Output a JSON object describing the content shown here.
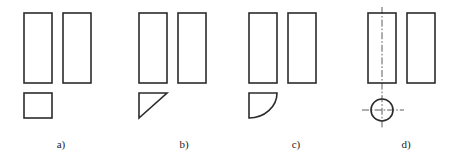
{
  "figure": {
    "background_color": "#ffffff",
    "line_color": "#2b2b2b",
    "centerline_color": "#4a4a4a",
    "label_color": "#1c1c1c",
    "stroke_width": 1.6,
    "centerline_stroke_width": 0.9,
    "centerline_dash": "7,2,1.6,2"
  },
  "panels": [
    {
      "id": "a",
      "label": "a)",
      "label_x": 61,
      "label_y": 148,
      "views": {
        "left_rect": {
          "x": 24,
          "y": 13,
          "width": 28,
          "height": 70
        },
        "right_rect": {
          "x": 63,
          "y": 13,
          "width": 28,
          "height": 70
        },
        "bottom_shape": {
          "type": "square",
          "x": 24,
          "y": 93,
          "width": 28,
          "height": 25
        }
      }
    },
    {
      "id": "b",
      "label": "b)",
      "label_x": 184,
      "label_y": 148,
      "views": {
        "left_rect": {
          "x": 139,
          "y": 13,
          "width": 28,
          "height": 70
        },
        "right_rect": {
          "x": 178,
          "y": 13,
          "width": 28,
          "height": 70
        },
        "bottom_shape": {
          "type": "right-triangle",
          "x": 139,
          "y": 93,
          "width": 28,
          "height": 25,
          "hypotenuse": "bottom-left-to-top-right"
        }
      }
    },
    {
      "id": "c",
      "label": "c)",
      "label_x": 296,
      "label_y": 148,
      "views": {
        "left_rect": {
          "x": 249,
          "y": 13,
          "width": 28,
          "height": 70
        },
        "right_rect": {
          "x": 288,
          "y": 13,
          "width": 28,
          "height": 70
        },
        "bottom_shape": {
          "type": "quarter-circle",
          "x": 249,
          "y": 93,
          "width": 28,
          "height": 25,
          "arc": "convex-from-bottom-left-to-top-right"
        }
      }
    },
    {
      "id": "d",
      "label": "d)",
      "label_x": 406,
      "label_y": 148,
      "views": {
        "left_rect": {
          "x": 368,
          "y": 13,
          "width": 28,
          "height": 70
        },
        "right_rect": {
          "x": 407,
          "y": 13,
          "width": 28,
          "height": 70
        },
        "bottom_shape": {
          "type": "circle",
          "center_x": 382,
          "center_y": 110,
          "radius": 11
        },
        "centerlines": {
          "vertical": {
            "x": 382,
            "y1": 7,
            "y2": 128
          },
          "horizontal": {
            "y": 110,
            "x1": 362,
            "x2": 404
          }
        }
      }
    }
  ]
}
